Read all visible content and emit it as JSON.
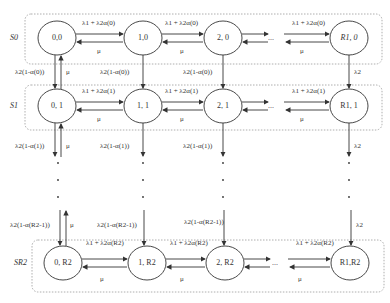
{
  "rows": [
    {
      "label": "S0",
      "states": [
        "0,0",
        "1,0",
        "2, 0",
        "R1, 0"
      ],
      "forward_rate": "λ1 + λ2α(0)",
      "backward_rate": "μ"
    },
    {
      "label": "S1",
      "states": [
        "0, 1",
        "1, 1",
        "2, 1",
        "R1, 1"
      ],
      "forward_rate": "λ1 + λ2α(1)",
      "backward_rate": "μ"
    },
    {
      "label": "SR2",
      "states": [
        "0, R2",
        "1, R2",
        "2, R2",
        "R1,R2"
      ],
      "forward_rate": "λ1 + λ2α(R2)",
      "backward_rate": "μ"
    }
  ],
  "vertical_rates": {
    "row0_to_row1": "λ2(1-α(0))",
    "row1_down": "λ2(1-α(1))",
    "to_last_row": "λ2(1-α(R2-1))",
    "last_column": "λ2",
    "up_rate": "μ"
  },
  "ellipsis": "...",
  "vertical_dots": "⋮"
}
